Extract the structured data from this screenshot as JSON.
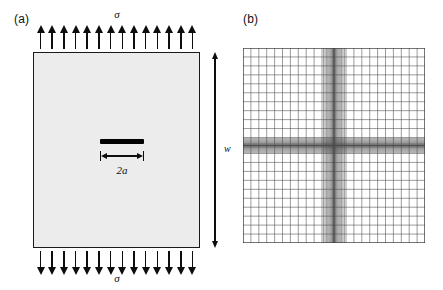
{
  "figure": {
    "panels": [
      {
        "key": "a",
        "label": "(a)",
        "caption_role": "cracked-plate-under-remote-tension"
      },
      {
        "key": "b",
        "label": "(b)",
        "caption_role": "finite-element-mesh"
      }
    ]
  },
  "panel_a": {
    "label": "(a)",
    "stress_label_top": "σ",
    "stress_label_bottom": "σ",
    "width_label": "w",
    "crack_label": "2a",
    "arrow_count_top": 14,
    "arrow_count_bottom": 14,
    "plate_fill_color": "#ececec",
    "plate_border_color": "#1a1a1a",
    "crack_color": "#000000",
    "arrow_color": "#0d0d0d"
  },
  "panel_b": {
    "label": "(b)",
    "mesh_line_color": "#4a4a4a",
    "mesh_background": "#ffffff",
    "coarse_divisions_x": 20,
    "coarse_divisions_y": 20,
    "refined_band_x_center_fraction": 0.5,
    "refined_band_y_center_fraction": 0.5,
    "refinement_description": "graded mesh refined in a vertical band and a horizontal band crossing at the crack centre"
  },
  "chart_data": {
    "type": "diagram",
    "title": "",
    "subtitle": "",
    "annotations": [
      "(a)",
      "σ",
      "σ",
      "w",
      "2a",
      "(b)"
    ]
  }
}
